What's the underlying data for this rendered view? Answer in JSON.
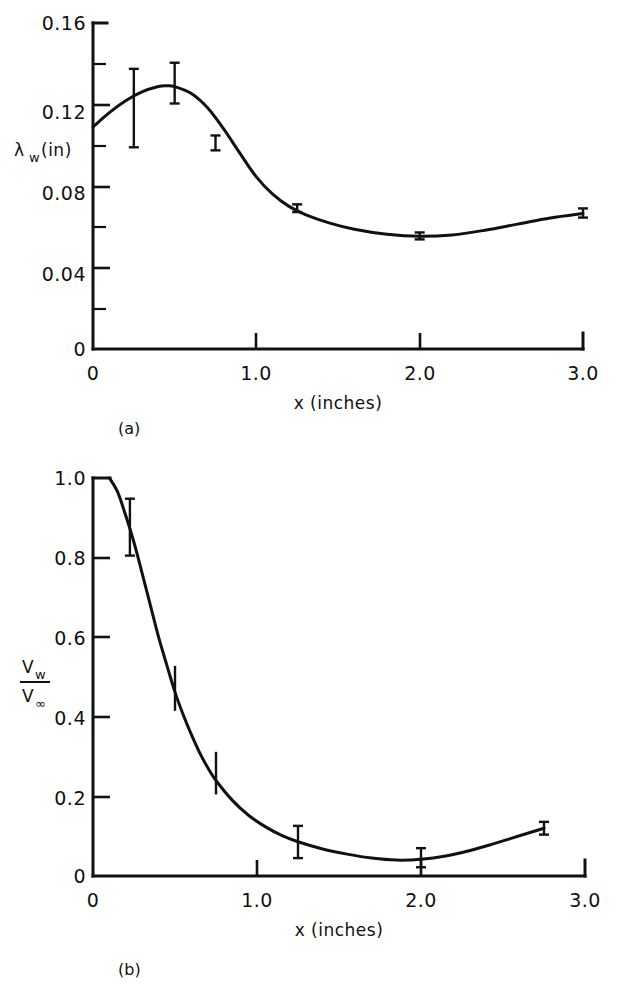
{
  "figure": {
    "panel_a_label": "(a)",
    "panel_b_label": "(b)"
  },
  "chart_data": [
    {
      "id": "panel-a",
      "type": "line",
      "title": "",
      "panel": "(a)",
      "xlabel": "x (inches)",
      "ylabel": "λ",
      "ylabel_sub": "w",
      "ylabel_unit": "(in)",
      "ylabel_full": "λ_w (in)",
      "xlim": [
        0,
        3.0
      ],
      "ylim": [
        0,
        0.16
      ],
      "grid": false,
      "legend": "none",
      "xticks": [
        0,
        1.0,
        2.0,
        3.0
      ],
      "xtick_labels": [
        "0",
        "1.0",
        "2.0",
        "3.0"
      ],
      "yticks": [
        0,
        0.04,
        0.08,
        0.12,
        0.16
      ],
      "ytick_labels": [
        "0",
        "0.04",
        "0.08",
        "0.12",
        "0.16"
      ],
      "yminor_ticks": [
        0.02,
        0.06,
        0.1,
        0.14
      ],
      "curve": [
        [
          0.0,
          0.109
        ],
        [
          0.1,
          0.116
        ],
        [
          0.2,
          0.1218
        ],
        [
          0.3,
          0.1262
        ],
        [
          0.4,
          0.1288
        ],
        [
          0.45,
          0.1292
        ],
        [
          0.5,
          0.1288
        ],
        [
          0.6,
          0.1255
        ],
        [
          0.7,
          0.1185
        ],
        [
          0.8,
          0.108
        ],
        [
          0.9,
          0.096
        ],
        [
          1.0,
          0.0845
        ],
        [
          1.1,
          0.076
        ],
        [
          1.2,
          0.07
        ],
        [
          1.3,
          0.066
        ],
        [
          1.45,
          0.0618
        ],
        [
          1.6,
          0.0588
        ],
        [
          1.8,
          0.0563
        ],
        [
          2.0,
          0.0553
        ],
        [
          2.2,
          0.056
        ],
        [
          2.4,
          0.0583
        ],
        [
          2.6,
          0.0613
        ],
        [
          2.8,
          0.0643
        ],
        [
          3.0,
          0.0665
        ]
      ],
      "points": [
        {
          "x": 0.25,
          "y": 0.124,
          "yerr_low": 0.099,
          "yerr_high": 0.1375,
          "cap": true
        },
        {
          "x": 0.5,
          "y": 0.1288,
          "yerr_low": 0.1205,
          "yerr_high": 0.1405,
          "cap": true
        },
        {
          "x": 0.75,
          "y": 0.101,
          "yerr_low": 0.0975,
          "yerr_high": 0.1048,
          "cap": true
        },
        {
          "x": 1.25,
          "y": 0.069,
          "yerr_low": 0.0672,
          "yerr_high": 0.071,
          "cap": true
        },
        {
          "x": 2.0,
          "y": 0.0553,
          "yerr_low": 0.0538,
          "yerr_high": 0.0572,
          "cap": true
        },
        {
          "x": 3.0,
          "y": 0.0665,
          "yerr_low": 0.0645,
          "yerr_high": 0.069,
          "cap": true
        }
      ]
    },
    {
      "id": "panel-b",
      "type": "line",
      "title": "",
      "panel": "(b)",
      "xlabel": "x (inches)",
      "ylabel_num": "V",
      "ylabel_num_sub": "w",
      "ylabel_den": "V",
      "ylabel_den_sub": "∞",
      "ylabel_full": "V_w / V_∞",
      "xlim": [
        0,
        3.0
      ],
      "ylim": [
        0,
        1.0
      ],
      "grid": false,
      "legend": "none",
      "xticks": [
        0,
        1.0,
        2.0,
        3.0
      ],
      "xtick_labels": [
        "0",
        "1.0",
        "2.0",
        "3.0"
      ],
      "yticks": [
        0,
        0.2,
        0.4,
        0.6,
        0.8,
        1.0
      ],
      "ytick_labels": [
        "0",
        "0.2",
        "0.4",
        "0.6",
        "0.8",
        "1.0"
      ],
      "curve": [
        [
          0.1,
          1.0
        ],
        [
          0.15,
          0.965
        ],
        [
          0.2,
          0.905
        ],
        [
          0.25,
          0.838
        ],
        [
          0.3,
          0.76
        ],
        [
          0.35,
          0.68
        ],
        [
          0.4,
          0.6
        ],
        [
          0.45,
          0.53
        ],
        [
          0.5,
          0.462
        ],
        [
          0.55,
          0.405
        ],
        [
          0.6,
          0.355
        ],
        [
          0.65,
          0.31
        ],
        [
          0.7,
          0.272
        ],
        [
          0.75,
          0.24
        ],
        [
          0.85,
          0.19
        ],
        [
          0.95,
          0.152
        ],
        [
          1.05,
          0.124
        ],
        [
          1.15,
          0.102
        ],
        [
          1.25,
          0.086
        ],
        [
          1.4,
          0.068
        ],
        [
          1.55,
          0.055
        ],
        [
          1.7,
          0.045
        ],
        [
          1.85,
          0.04
        ],
        [
          2.0,
          0.042
        ],
        [
          2.15,
          0.05
        ],
        [
          2.3,
          0.064
        ],
        [
          2.45,
          0.082
        ],
        [
          2.6,
          0.101
        ],
        [
          2.75,
          0.12
        ]
      ],
      "points": [
        {
          "x": 0.225,
          "y": 0.878,
          "yerr_low": 0.805,
          "yerr_high": 0.948,
          "cap": true
        },
        {
          "x": 0.5,
          "y": 0.462,
          "yerr_low": 0.415,
          "yerr_high": 0.528,
          "cap": false
        },
        {
          "x": 0.75,
          "y": 0.24,
          "yerr_low": 0.205,
          "yerr_high": 0.312,
          "cap": false
        },
        {
          "x": 1.25,
          "y": 0.086,
          "yerr_low": 0.045,
          "yerr_high": 0.126,
          "cap": true
        },
        {
          "x": 2.0,
          "y": 0.042,
          "yerr_low": 0.022,
          "yerr_high": 0.07,
          "cap": true
        },
        {
          "x": 2.75,
          "y": 0.12,
          "yerr_low": 0.104,
          "yerr_high": 0.136,
          "cap": true
        }
      ]
    }
  ]
}
